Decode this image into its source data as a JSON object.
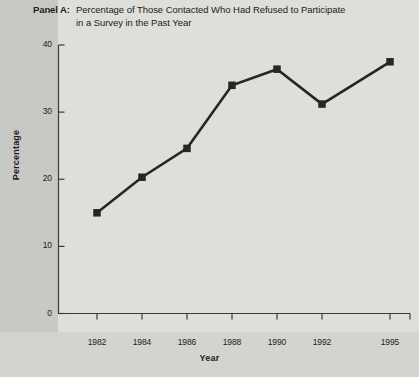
{
  "panel": {
    "label": "Panel A:",
    "title_line_1": "Percentage of Those Contacted Who Had Refused to Participate",
    "title_line_2": "in a Survey in the Past Year"
  },
  "chart_data": {
    "type": "line",
    "title": "Percentage of Those Contacted Who Had Refused to Participate in a Survey in the Past Year",
    "xlabel": "Year",
    "ylabel": "Percentage",
    "categories": [
      "1982",
      "1984",
      "1986",
      "1988",
      "1990",
      "1992",
      "1995"
    ],
    "x": [
      1982,
      1984,
      1986,
      1988,
      1990,
      1992,
      1995
    ],
    "values": [
      15.0,
      20.3,
      24.6,
      34.0,
      36.4,
      31.2,
      37.5
    ],
    "series": [
      {
        "name": "Percentage refused",
        "values": [
          15.0,
          20.3,
          24.6,
          34.0,
          36.4,
          31.2,
          37.5
        ]
      }
    ],
    "ylim": [
      0,
      40
    ],
    "yticks": [
      0,
      10,
      20,
      30,
      40
    ],
    "ytick_labels": [
      "0",
      "10",
      "20",
      "30",
      "40"
    ],
    "xticks": [
      1982,
      1984,
      1986,
      1988,
      1990,
      1992,
      1995
    ],
    "xtick_labels": [
      "1982",
      "1984",
      "1986",
      "1988",
      "1990",
      "1992",
      "1995"
    ],
    "grid": false,
    "legend": "none",
    "marker": "square",
    "line_color": "#262626",
    "marker_color": "#262626",
    "axis_color": "#3a3a3a",
    "plot_background": "#dededa",
    "page_background": "#d6d6d2"
  }
}
